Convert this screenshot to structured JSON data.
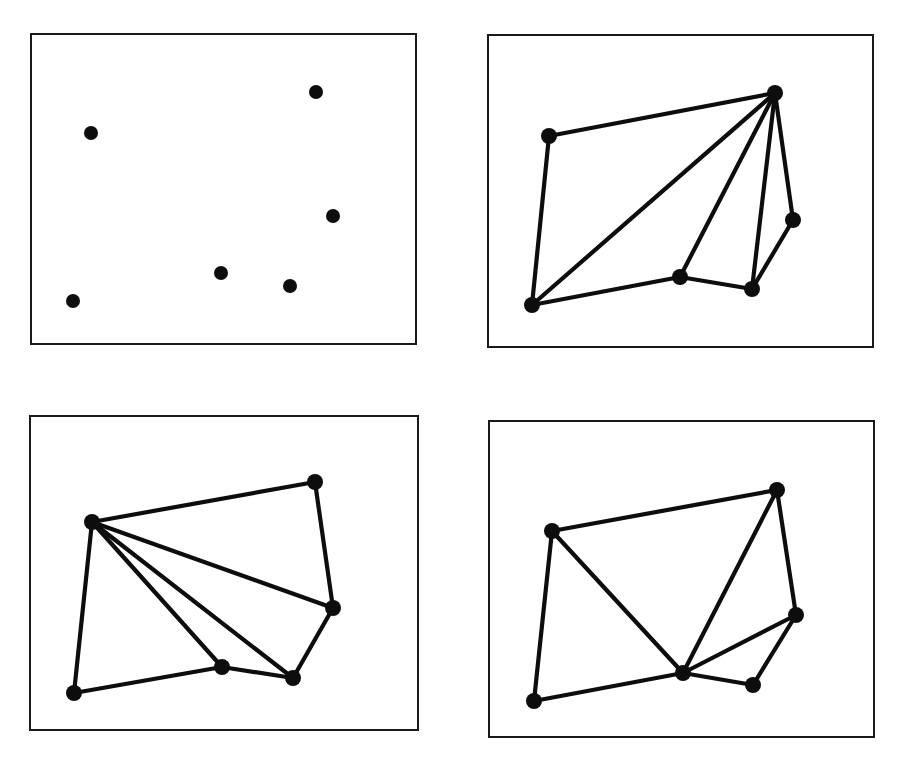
{
  "figure": {
    "title": "",
    "width": 897,
    "height": 769,
    "background_color": "#ffffff",
    "ink_color": "#0d0d0d",
    "frame_color": "#1a1a1a",
    "panel_count": 4,
    "layout": "2x2 grid of bordered rectangular panels"
  },
  "chart_data": {
    "type": "scatter",
    "title": "",
    "xlabel": "",
    "ylabel": "",
    "grid": false,
    "legend": null,
    "axis_ticks": false,
    "panels": [
      {
        "id": "panel-top-left",
        "name": "point-set",
        "label": "",
        "frame": {
          "x": 31,
          "y": 34,
          "width": 385,
          "height": 310
        },
        "node_radius": 7,
        "nodes": [
          {
            "id": "p1",
            "x": 91,
            "y": 133
          },
          {
            "id": "p2",
            "x": 316,
            "y": 92
          },
          {
            "id": "p3",
            "x": 333,
            "y": 216
          },
          {
            "id": "p4",
            "x": 221,
            "y": 273
          },
          {
            "id": "p5",
            "x": 290,
            "y": 286
          },
          {
            "id": "p6",
            "x": 73,
            "y": 301
          }
        ],
        "edges": []
      },
      {
        "id": "panel-top-right",
        "name": "graph-fan-from-top-right",
        "label": "",
        "frame": {
          "x": 488,
          "y": 35,
          "width": 385,
          "height": 312
        },
        "node_radius": 8,
        "nodes": [
          {
            "id": "q1",
            "x": 549,
            "y": 136
          },
          {
            "id": "q2",
            "x": 775,
            "y": 93
          },
          {
            "id": "q3",
            "x": 793,
            "y": 220
          },
          {
            "id": "q4",
            "x": 680,
            "y": 277
          },
          {
            "id": "q5",
            "x": 752,
            "y": 289
          },
          {
            "id": "q6",
            "x": 532,
            "y": 305
          }
        ],
        "edges": [
          [
            "q1",
            "q2"
          ],
          [
            "q1",
            "q6"
          ],
          [
            "q2",
            "q3"
          ],
          [
            "q2",
            "q4"
          ],
          [
            "q2",
            "q5"
          ],
          [
            "q2",
            "q6"
          ],
          [
            "q3",
            "q5"
          ],
          [
            "q4",
            "q5"
          ],
          [
            "q4",
            "q6"
          ]
        ]
      },
      {
        "id": "panel-bottom-left",
        "name": "graph-fan-from-left",
        "label": "",
        "frame": {
          "x": 30,
          "y": 416,
          "width": 388,
          "height": 314
        },
        "node_radius": 8,
        "nodes": [
          {
            "id": "r1",
            "x": 92,
            "y": 522
          },
          {
            "id": "r2",
            "x": 315,
            "y": 482
          },
          {
            "id": "r3",
            "x": 333,
            "y": 608
          },
          {
            "id": "r4",
            "x": 222,
            "y": 667
          },
          {
            "id": "r5",
            "x": 293,
            "y": 678
          },
          {
            "id": "r6",
            "x": 74,
            "y": 693
          }
        ],
        "edges": [
          [
            "r1",
            "r2"
          ],
          [
            "r1",
            "r3"
          ],
          [
            "r1",
            "r4"
          ],
          [
            "r1",
            "r5"
          ],
          [
            "r1",
            "r6"
          ],
          [
            "r2",
            "r3"
          ],
          [
            "r3",
            "r5"
          ],
          [
            "r4",
            "r5"
          ],
          [
            "r4",
            "r6"
          ]
        ]
      },
      {
        "id": "panel-bottom-right",
        "name": "graph-fan-from-center",
        "label": "",
        "frame": {
          "x": 489,
          "y": 421,
          "width": 385,
          "height": 316
        },
        "node_radius": 8,
        "nodes": [
          {
            "id": "s1",
            "x": 552,
            "y": 531
          },
          {
            "id": "s2",
            "x": 777,
            "y": 490
          },
          {
            "id": "s3",
            "x": 796,
            "y": 615
          },
          {
            "id": "s4",
            "x": 683,
            "y": 673
          },
          {
            "id": "s5",
            "x": 753,
            "y": 685
          },
          {
            "id": "s6",
            "x": 534,
            "y": 701
          }
        ],
        "edges": [
          [
            "s1",
            "s2"
          ],
          [
            "s1",
            "s4"
          ],
          [
            "s1",
            "s6"
          ],
          [
            "s2",
            "s3"
          ],
          [
            "s2",
            "s4"
          ],
          [
            "s3",
            "s4"
          ],
          [
            "s3",
            "s5"
          ],
          [
            "s4",
            "s5"
          ],
          [
            "s4",
            "s6"
          ]
        ]
      }
    ]
  }
}
